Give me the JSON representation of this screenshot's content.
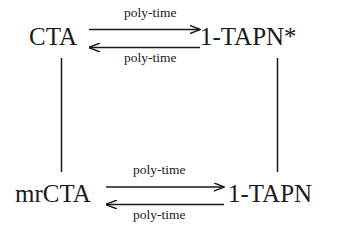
{
  "diagram": {
    "type": "commutative-reduction-diagram",
    "background_color": "#ffffff",
    "stroke_color": "#1a1a1a",
    "nodes": [
      {
        "id": "cta",
        "label": "CTA",
        "position": "top-left"
      },
      {
        "id": "tapn_star",
        "label": "1-TAPN*",
        "position": "top-right"
      },
      {
        "id": "mrcta",
        "label": "mrCTA",
        "position": "bottom-left"
      },
      {
        "id": "tapn",
        "label": "1-TAPN",
        "position": "bottom-right"
      }
    ],
    "edges": [
      {
        "id": "top_forward",
        "from": "cta",
        "to": "tapn_star",
        "direction": "right",
        "label": "poly-time"
      },
      {
        "id": "top_backward",
        "from": "tapn_star",
        "to": "cta",
        "direction": "left",
        "label": "poly-time"
      },
      {
        "id": "bottom_forward",
        "from": "mrcta",
        "to": "tapn",
        "direction": "right",
        "label": "poly-time"
      },
      {
        "id": "bottom_backward",
        "from": "tapn",
        "to": "mrcta",
        "direction": "left",
        "label": "poly-time"
      },
      {
        "id": "left_vertical",
        "from": "cta",
        "to": "mrcta",
        "direction": "none",
        "label": ""
      },
      {
        "id": "right_vertical",
        "from": "tapn_star",
        "to": "tapn",
        "direction": "none",
        "label": ""
      }
    ],
    "labels": {
      "top_above": "poly-time",
      "top_below": "poly-time",
      "bottom_above": "poly-time",
      "bottom_below": "poly-time"
    }
  }
}
